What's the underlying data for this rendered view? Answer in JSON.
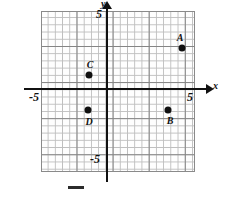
{
  "chart_data": {
    "type": "scatter",
    "title": "",
    "xlabel": "x",
    "ylabel": "y",
    "xlim": [
      -5.7,
      6.1
    ],
    "ylim": [
      -5.4,
      5.8
    ],
    "grid": true,
    "minor_grid": true,
    "legend": "none",
    "x_tick_labels": [
      "-5",
      "5"
    ],
    "y_tick_labels": [
      "5",
      "-5"
    ],
    "points": [
      {
        "label": "A",
        "x": 4.2,
        "y": 2.8
      },
      {
        "label": "B",
        "x": 4.2,
        "y": -1.5
      },
      {
        "label": "C",
        "x": -1.4,
        "y": 1.0
      },
      {
        "label": "D",
        "x": -1.4,
        "y": -1.5
      }
    ]
  },
  "axes": {
    "x_name": "x",
    "y_name": "y",
    "x_neg_tick": "-5",
    "x_pos_tick": "5",
    "y_pos_tick": "5",
    "y_neg_tick": "-5"
  },
  "points": {
    "a": {
      "label": "A",
      "left": "182px",
      "top": "48px",
      "label_left": "180px",
      "label_top": "37px"
    },
    "b": {
      "label": "B",
      "left": "168px",
      "top": "110px",
      "label_left": "170px",
      "label_top": "120px"
    },
    "c": {
      "label": "C",
      "left": "89px",
      "top": "75px",
      "label_left": "90px",
      "label_top": "64px"
    },
    "d": {
      "label": "D",
      "left": "88px",
      "top": "110px",
      "label_left": "89px",
      "label_top": "121px"
    }
  },
  "colors": {
    "ink": "#111111",
    "grid_major": "#7a7a7a",
    "grid_minor": "#b9b9b9",
    "background": "#ffffff"
  }
}
